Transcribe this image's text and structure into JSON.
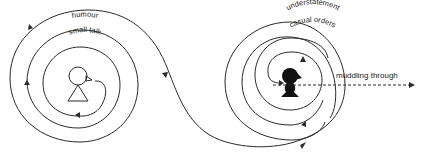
{
  "diagram": {
    "left_spiral": {
      "outer_label": "humour",
      "inner_label": "small talk",
      "figure": "outline-person-with-hat"
    },
    "right_spiral": {
      "outer_label": "understatement",
      "inner_label": "casual orders",
      "figure": "solid-person-with-hat"
    },
    "exit_label": "muddling through",
    "colors": {
      "line": "#2a2a2a",
      "figure_fill": "#111111",
      "background": "#ffffff"
    }
  }
}
